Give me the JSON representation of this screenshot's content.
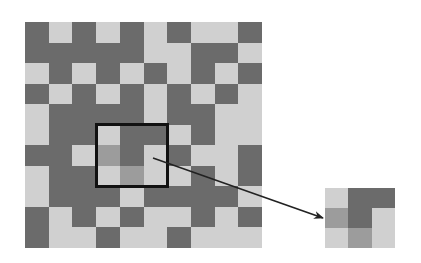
{
  "colors": {
    "D": "#6b6b6b",
    "L": "#d0d0d0",
    "M": "#9c9c9c",
    "box_stroke": "#111111",
    "arrow": "#222222"
  },
  "grid": {
    "cols": 10,
    "rows": 11,
    "cells": [
      "DLDLDLDLLD",
      "DDDDDLLDDL",
      "LDLDLDLDLD",
      "DLDLDLDLDL",
      "LDDDDLDDLL",
      "LDDLDDLDLL",
      "DDLMDLDLLD",
      "LDDLMLLDLD",
      "LDDDLDDDDL",
      "DLDLDLLDLD",
      "DLLDLLDLLL"
    ]
  },
  "highlight_box": {
    "col": 3,
    "row": 5,
    "cols": 3,
    "rows": 3
  },
  "inset": {
    "cells": [
      "LDD",
      "MDL",
      "LML"
    ]
  },
  "arrow": {
    "x1": 153,
    "y1": 158,
    "x2": 323,
    "y2": 218
  }
}
